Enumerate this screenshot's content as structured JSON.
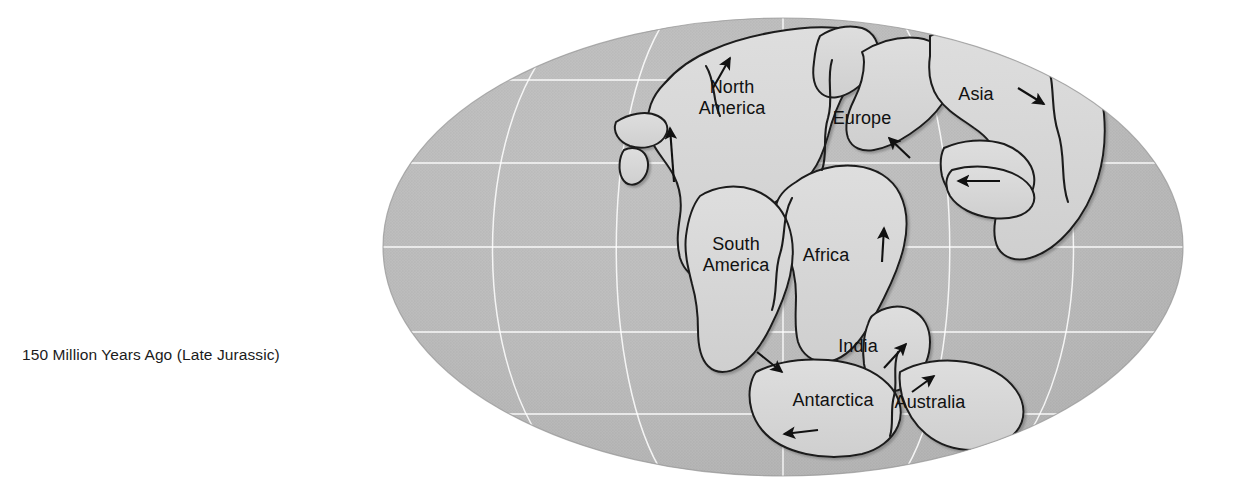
{
  "figure": {
    "caption": "150 Million Years Ago (Late Jurassic)",
    "projection": "Mollweide oval world projection",
    "colors": {
      "background": "#ffffff",
      "ocean": "#b6b6b6",
      "ocean_shadow": "#9d9d9d",
      "land": "#d9d9d9",
      "land_highlight": "#f2f2f2",
      "coastline": "#1a1a1a",
      "graticule": "#ffffff",
      "label_text": "#111111",
      "arrow": "#111111"
    }
  },
  "globe": {
    "center_x": 783,
    "center_y": 247,
    "radius_x": 400,
    "radius_y": 229,
    "graticule": {
      "latitudes": [
        {
          "name": "60N",
          "y": 80
        },
        {
          "name": "30N",
          "y": 163
        },
        {
          "name": "equator",
          "y": 247
        },
        {
          "name": "30S",
          "y": 332
        },
        {
          "name": "60S",
          "y": 414
        }
      ],
      "meridians": [
        {
          "name": "meridian-left",
          "x_at_equator": 600
        },
        {
          "name": "meridian-center",
          "x_at_equator": 783
        },
        {
          "name": "meridian-right",
          "x_at_equator": 966
        }
      ]
    }
  },
  "labels": [
    {
      "id": "north-america",
      "lines": [
        "North",
        "America"
      ],
      "x": 732,
      "y": 98
    },
    {
      "id": "europe",
      "lines": [
        "Europe"
      ],
      "x": 862,
      "y": 118
    },
    {
      "id": "asia",
      "lines": [
        "Asia"
      ],
      "x": 976,
      "y": 94
    },
    {
      "id": "south-america",
      "lines": [
        "South",
        "America"
      ],
      "x": 736,
      "y": 255
    },
    {
      "id": "africa",
      "lines": [
        "Africa"
      ],
      "x": 826,
      "y": 255
    },
    {
      "id": "india",
      "lines": [
        "India"
      ],
      "x": 858,
      "y": 346
    },
    {
      "id": "antarctica",
      "lines": [
        "Antarctica"
      ],
      "x": 833,
      "y": 400
    },
    {
      "id": "australia",
      "lines": [
        "Australia"
      ],
      "x": 930,
      "y": 402
    }
  ],
  "motion_arrows": [
    {
      "id": "arrow-north-america-north",
      "x1": 674,
      "y1": 182,
      "x2": 670,
      "y2": 128,
      "direction": "north"
    },
    {
      "id": "arrow-arctic-north",
      "x1": 713,
      "y1": 88,
      "x2": 730,
      "y2": 58,
      "direction": "northeast"
    },
    {
      "id": "arrow-europe-northeast",
      "x1": 910,
      "y1": 158,
      "x2": 889,
      "y2": 138,
      "direction": "northwest"
    },
    {
      "id": "arrow-asia-southwest",
      "x1": 1018,
      "y1": 88,
      "x2": 1044,
      "y2": 104,
      "direction": "southeast"
    },
    {
      "id": "arrow-tethys-west",
      "x1": 1000,
      "y1": 181,
      "x2": 958,
      "y2": 181,
      "direction": "west"
    },
    {
      "id": "arrow-africa-north",
      "x1": 882,
      "y1": 262,
      "x2": 884,
      "y2": 228,
      "direction": "north"
    },
    {
      "id": "arrow-south-america-southeast",
      "x1": 757,
      "y1": 352,
      "x2": 782,
      "y2": 372,
      "direction": "southeast"
    },
    {
      "id": "arrow-india-northeast",
      "x1": 884,
      "y1": 368,
      "x2": 906,
      "y2": 344,
      "direction": "northeast"
    },
    {
      "id": "arrow-australia-northeast",
      "x1": 912,
      "y1": 392,
      "x2": 934,
      "y2": 376,
      "direction": "northeast"
    },
    {
      "id": "arrow-antarctica-west",
      "x1": 818,
      "y1": 430,
      "x2": 784,
      "y2": 434,
      "direction": "west"
    }
  ]
}
